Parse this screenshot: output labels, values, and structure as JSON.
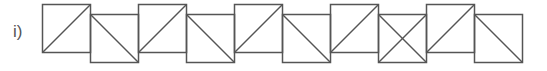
{
  "label": "i)",
  "stroke_color": "#555555",
  "squares": [
    {
      "x": 42,
      "y": 4,
      "size": 48,
      "diagonal": "/"
    },
    {
      "x": 90,
      "y": 14,
      "size": 48,
      "diagonal": "\\"
    },
    {
      "x": 138,
      "y": 4,
      "size": 48,
      "diagonal": "/"
    },
    {
      "x": 186,
      "y": 14,
      "size": 48,
      "diagonal": "\\"
    },
    {
      "x": 234,
      "y": 4,
      "size": 48,
      "diagonal": "/"
    },
    {
      "x": 282,
      "y": 14,
      "size": 48,
      "diagonal": "\\"
    },
    {
      "x": 330,
      "y": 4,
      "size": 48,
      "diagonal": "/"
    },
    {
      "x": 378,
      "y": 14,
      "size": 48,
      "diagonal": "x"
    },
    {
      "x": 426,
      "y": 4,
      "size": 48,
      "diagonal": "/"
    },
    {
      "x": 474,
      "y": 14,
      "size": 48,
      "diagonal": "\\"
    }
  ]
}
